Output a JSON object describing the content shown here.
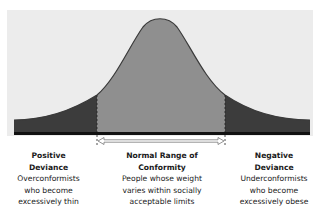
{
  "diagram": {
    "type": "normal-distribution-curve",
    "colors": {
      "background_panel": "#ececec",
      "tails": "#3c3c3c",
      "center": "#8f8f8f",
      "curve_outline": "#3a3a3a",
      "baseline": "#111111"
    },
    "regions": [
      {
        "id": "positive",
        "title_line1": "Positive",
        "title_line2": "Deviance",
        "desc_line1": "Overconformists",
        "desc_line2": "who become",
        "desc_line3": "excessively thin"
      },
      {
        "id": "normal",
        "title_line1": "Normal Range of",
        "title_line2": "Conformity",
        "desc_line1": "People whose weight",
        "desc_line2": "varies within socially",
        "desc_line3": "acceptable limits"
      },
      {
        "id": "negative",
        "title_line1": "Negative",
        "title_line2": "Deviance",
        "desc_line1": "Underconformists",
        "desc_line2": "who become",
        "desc_line3": "excessively obese"
      }
    ]
  }
}
